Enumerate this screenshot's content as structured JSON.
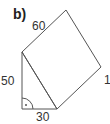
{
  "figure": {
    "label": "b)",
    "labels": {
      "top_edge": "60",
      "left_edge": "50",
      "bottom_edge": "30",
      "right_edge": "1"
    },
    "right_angle_marker": "right-angle-with-dot",
    "stroke_color": "#555555"
  }
}
